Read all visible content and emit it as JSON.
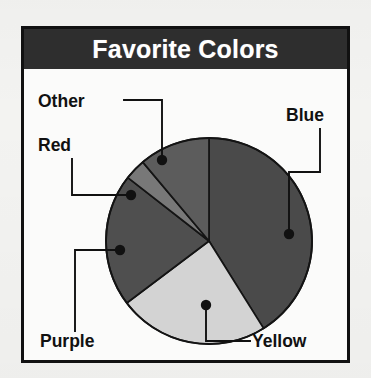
{
  "figure": {
    "title": "Favorite Colors",
    "frame_color": "#111111",
    "banner_color": "#2e2e2e",
    "banner_text_color": "#ffffff",
    "page_background": "#f3f3f1",
    "plot_background": "#fbfbfa"
  },
  "chart_data": {
    "type": "pie",
    "title": "Favorite Colors",
    "xlabel": "",
    "ylabel": "",
    "labels": [
      "Blue",
      "Yellow",
      "Purple",
      "Red",
      "Other"
    ],
    "values": [
      41,
      24,
      21,
      3,
      11
    ],
    "units": "percent",
    "start_angle_deg": -90,
    "direction": "clockwise",
    "legend": "none",
    "grid": false,
    "annotations": "each slice is labeled with an external text label joined by an elbow leader line ending in a filled dot placed inside the slice",
    "slices": [
      {
        "name": "Blue",
        "label": "Blue",
        "value": 41,
        "sweep_deg": 148,
        "start_deg": -90,
        "end_deg": 58,
        "fill": "#4a4a4a",
        "label_x": 300,
        "label_y": 52,
        "label_anchor": "end",
        "dot_x": 265,
        "dot_y": 165,
        "leader_points": "296,60 296,103 265,103 265,165"
      },
      {
        "name": "Yellow",
        "label": "Yellow",
        "value": 24,
        "sweep_deg": 85,
        "start_deg": 58,
        "end_deg": 143,
        "fill": "#d3d3d3",
        "label_x": 228,
        "label_y": 278,
        "label_anchor": "start",
        "dot_x": 182,
        "dot_y": 236,
        "leader_points": "182,236 182,272 226,272"
      },
      {
        "name": "Purple",
        "label": "Purple",
        "value": 21,
        "sweep_deg": 75,
        "start_deg": 143,
        "end_deg": 218,
        "fill": "#4f4f4f",
        "label_x": 16,
        "label_y": 278,
        "label_anchor": "start",
        "dot_x": 96,
        "dot_y": 181,
        "leader_points": "96,181 51,181 51,262"
      },
      {
        "name": "Red",
        "label": "Red",
        "value": 3,
        "sweep_deg": 12,
        "start_deg": 218,
        "end_deg": 230,
        "fill": "#787878",
        "label_x": 14,
        "label_y": 82,
        "label_anchor": "start",
        "dot_x": 107,
        "dot_y": 126,
        "leader_points": "48,90 48,126 107,126"
      },
      {
        "name": "Other",
        "label": "Other",
        "value": 11,
        "sweep_deg": 40,
        "start_deg": 230,
        "end_deg": 270,
        "fill": "#5c5c5c",
        "label_x": 14,
        "label_y": 38,
        "label_anchor": "start",
        "dot_x": 138,
        "dot_y": 91,
        "leader_points": "100,31 138,31 138,91"
      }
    ],
    "geometry": {
      "center_x": 185,
      "center_y": 172,
      "radius": 103
    }
  }
}
